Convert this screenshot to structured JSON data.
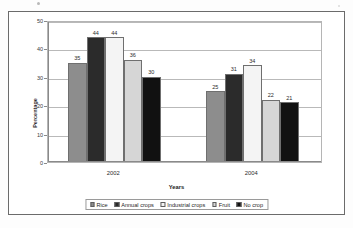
{
  "chart_data": {
    "type": "bar",
    "title": "",
    "xlabel": "Years",
    "ylabel": "Percentage",
    "categories": [
      "2002",
      "2004"
    ],
    "ylim": [
      0,
      50
    ],
    "yticks": [
      0,
      10,
      20,
      30,
      40,
      50
    ],
    "ytick_labels": [
      "0",
      "10",
      "20",
      "30",
      "40",
      "50"
    ],
    "grid": true,
    "legend_position": "bottom",
    "series": [
      {
        "name": "Rice",
        "values": [
          35,
          25
        ],
        "color": "#8d8d8d"
      },
      {
        "name": "Annual crops",
        "values": [
          44,
          31
        ],
        "color": "#2b2b2b"
      },
      {
        "name": "Industrial crops",
        "values": [
          44,
          34
        ],
        "color": "#f4f4f4"
      },
      {
        "name": "Fruit",
        "values": [
          36,
          22
        ],
        "color": "#d6d6d6"
      },
      {
        "name": "No crop",
        "values": [
          30,
          21
        ],
        "color": "#111111"
      }
    ],
    "data_labels": {
      "2002": [
        "35",
        "44",
        "44",
        "36",
        "30"
      ],
      "2004": [
        "25",
        "31",
        "34",
        "22",
        "21"
      ]
    }
  },
  "colors": {
    "frame": "#6b6b6b",
    "gridline": "#b9b9b9",
    "axis": "#8a8a8a",
    "text": "#2b2b2b",
    "background": "#ffffff"
  }
}
